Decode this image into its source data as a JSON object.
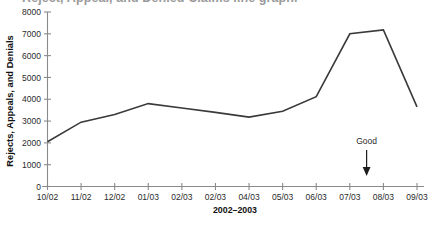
{
  "figure": {
    "clipped_title": "Reject, Appeal, and Denied Claims line graph.",
    "background_color": "#ffffff",
    "line_color": "#3a3a3a",
    "axis_color": "#8a8a8a"
  },
  "annotation": {
    "label": "Good",
    "icon": "down-arrow-icon"
  },
  "chart_data": {
    "type": "line",
    "title": "",
    "xlabel": "2002–2003",
    "ylabel": "Rejects, Appeals, and Denials",
    "categories": [
      "10/02",
      "11/02",
      "12/02",
      "01/03",
      "02/03",
      "02/03",
      "04/03",
      "05/03",
      "06/03",
      "07/03",
      "08/03",
      "09/03"
    ],
    "values": [
      2050,
      2950,
      3300,
      3800,
      3600,
      3400,
      3180,
      3450,
      4120,
      7000,
      7180,
      3650
    ],
    "series": [
      {
        "name": "Rejects, Appeals, and Denials",
        "values": [
          2050,
          2950,
          3300,
          3800,
          3600,
          3400,
          3180,
          3450,
          4120,
          7000,
          7180,
          3650
        ]
      }
    ],
    "ylim": [
      0,
      8000
    ],
    "ytick_labels": [
      "0",
      "1000",
      "2000",
      "3000",
      "4000",
      "5000",
      "6000",
      "7000",
      "8000"
    ],
    "ytick_values": [
      0,
      1000,
      2000,
      3000,
      4000,
      5000,
      6000,
      7000,
      8000
    ],
    "grid": false,
    "legend": "none",
    "annotations": [
      {
        "text": "Good",
        "x_category": "07/03",
        "direction": "down"
      }
    ]
  }
}
